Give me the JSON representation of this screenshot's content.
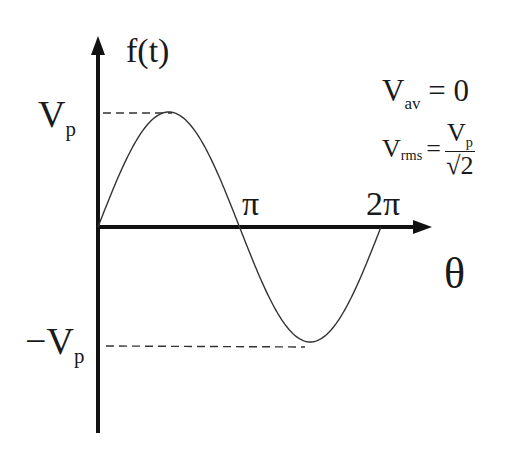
{
  "chart_data": {
    "type": "line",
    "title": "",
    "xlabel": "θ",
    "ylabel": "f(t)",
    "x_ticks": [
      "π",
      "2π"
    ],
    "y_ticks": [
      "V_p",
      "−V_p"
    ],
    "series": [
      {
        "name": "sine wave",
        "function": "Vp·sin(θ)",
        "x": [
          0,
          0.5,
          1,
          1.5,
          2
        ],
        "x_unit": "π",
        "values": [
          0,
          1,
          0,
          -1,
          0
        ],
        "y_unit": "Vp"
      }
    ],
    "xlim": [
      "0",
      "2π"
    ],
    "ylim": [
      "−V_p",
      "V_p"
    ],
    "grid": false,
    "annotations": [
      "V_av = 0",
      "V_rms = V_p / √2"
    ]
  },
  "axes": {
    "y_label": {
      "main": "f",
      "paren": "(t)"
    },
    "x_label": "θ",
    "tick_pi": "π",
    "tick_2pi": "2π",
    "vp_label": {
      "main": "V",
      "sub": "p"
    },
    "neg_vp_label": {
      "main": "−V",
      "sub": "p"
    }
  },
  "formulas": {
    "vav": {
      "main": "V",
      "sub": "av",
      "rhs": "= 0"
    },
    "vrms": {
      "main": "V",
      "sub": "rms",
      "eq": "=",
      "num_main": "V",
      "num_sub": "p",
      "den": "√2"
    }
  },
  "colors": {
    "axis": "#111111",
    "curve": "#333333",
    "dashes": "#333333"
  }
}
